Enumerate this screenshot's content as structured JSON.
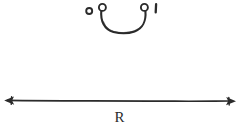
{
  "figure": {
    "title": "hand-drawn real line with open interval arc",
    "background_color": "#ffffff",
    "ink_color": "#2b2b2b",
    "width": 240,
    "height": 128,
    "axis_label": "R",
    "endpoint_labels": {
      "left": "0",
      "right": "1"
    },
    "marks": [
      {
        "name": "zero-marker",
        "kind": "open-circle",
        "label": "0",
        "cx": 89.2,
        "cy": 11.0,
        "r": 3.1
      },
      {
        "name": "arc-left-endpoint",
        "kind": "open-circle",
        "cx": 102.4,
        "cy": 7.4,
        "r": 3.6
      },
      {
        "name": "arc-right-endpoint",
        "kind": "open-circle",
        "cx": 144.4,
        "cy": 7.4,
        "r": 3.6
      },
      {
        "name": "one-tick",
        "kind": "vertical-tick",
        "label": "1",
        "x": 156.0,
        "y_top": 4.0,
        "y_bottom": 12.5
      }
    ],
    "arc": {
      "name": "interval-arc",
      "shape": "u-curve",
      "start_x": 101.6,
      "start_y": 11.0,
      "end_x": 145.2,
      "end_y": 11.0,
      "bottom_y": 31.5,
      "stroke_width": 2.0
    },
    "number_line": {
      "name": "real-line",
      "y": 100.8,
      "x_start": 5.0,
      "x_end": 235.0,
      "stroke_width": 1.6,
      "arrowheads": [
        "left",
        "right"
      ],
      "label": "R",
      "label_x": 119.5,
      "label_y": 121.0
    }
  }
}
